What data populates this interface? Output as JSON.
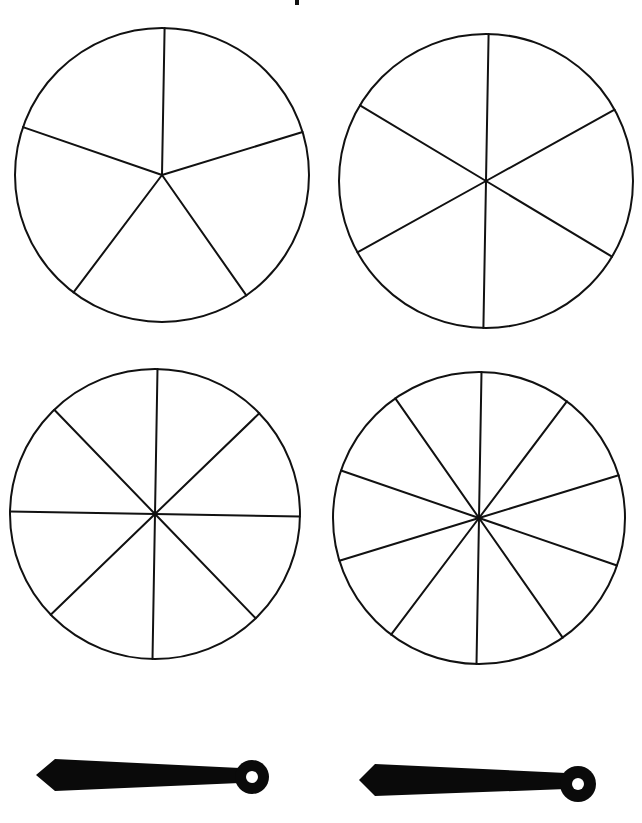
{
  "page": {
    "background": "#ffffff",
    "line_color": "#111111",
    "fill_color": "#0a0a0a"
  },
  "top_mark": {
    "x": 295,
    "y": 0,
    "w": 4,
    "h": 5
  },
  "spinners": [
    {
      "name": "spinner-5-sections",
      "sections": 5,
      "cx": 162,
      "cy": 175,
      "r": 147,
      "start_angle_deg": -89
    },
    {
      "name": "spinner-6-sections",
      "sections": 6,
      "cx": 486,
      "cy": 181,
      "r": 147,
      "start_angle_deg": -89
    },
    {
      "name": "spinner-8-sections",
      "sections": 8,
      "cx": 155,
      "cy": 514,
      "r": 145,
      "start_angle_deg": -89
    },
    {
      "name": "spinner-10-sections",
      "sections": 10,
      "cx": 479,
      "cy": 518,
      "r": 146,
      "start_angle_deg": -89
    }
  ],
  "pointers": [
    {
      "name": "pointer-left",
      "tip_x": 36,
      "tip_y": 775,
      "shoulder_x": 55,
      "end_x": 240,
      "top_start": 759,
      "top_end": 768,
      "bot_start": 791,
      "bot_end": 783,
      "hub_cx": 252,
      "hub_cy": 777,
      "hub_r": 17,
      "hole_r": 6
    },
    {
      "name": "pointer-right",
      "tip_x": 359,
      "tip_y": 780,
      "shoulder_x": 375,
      "end_x": 566,
      "top_start": 764,
      "top_end": 773,
      "bot_start": 796,
      "bot_end": 789,
      "hub_cx": 578,
      "hub_cy": 784,
      "hub_r": 18,
      "hole_r": 6
    }
  ]
}
